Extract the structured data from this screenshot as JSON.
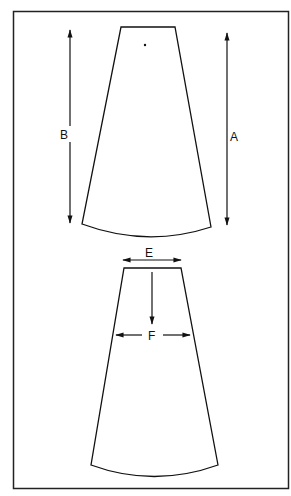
{
  "diagram": {
    "labels": {
      "A": "A",
      "B": "B",
      "E": "E",
      "F": "F"
    },
    "pieces": [
      {
        "name": "upper-panel",
        "marker": "dot"
      },
      {
        "name": "lower-panel"
      }
    ],
    "colors": {
      "line": "#111111",
      "background": "#ffffff",
      "frame": "#222222"
    }
  }
}
